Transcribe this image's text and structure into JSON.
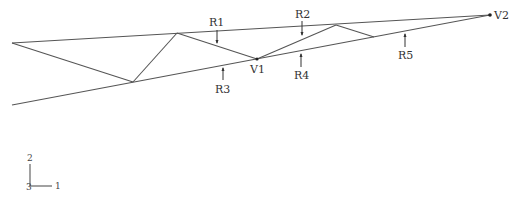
{
  "diagram": {
    "type": "truss-schematic",
    "colors": {
      "line": "#555555",
      "text": "#333333",
      "background": "#ffffff"
    },
    "nodes": {
      "left_top": [
        12,
        43
      ],
      "left_bottom": [
        12,
        105
      ],
      "bottom_1": [
        133,
        82
      ],
      "top_1": [
        177,
        33
      ],
      "V1": [
        257,
        59
      ],
      "top_2": [
        336,
        25
      ],
      "bottom_2": [
        374,
        37
      ],
      "V2": [
        490,
        15
      ]
    },
    "labels": {
      "R1": "R1",
      "R2": "R2",
      "R3": "R3",
      "R4": "R4",
      "R5": "R5",
      "V1": "V1",
      "V2": "V2"
    },
    "axes": {
      "x_label": "1",
      "y_label": "2",
      "z_label": "3"
    }
  }
}
